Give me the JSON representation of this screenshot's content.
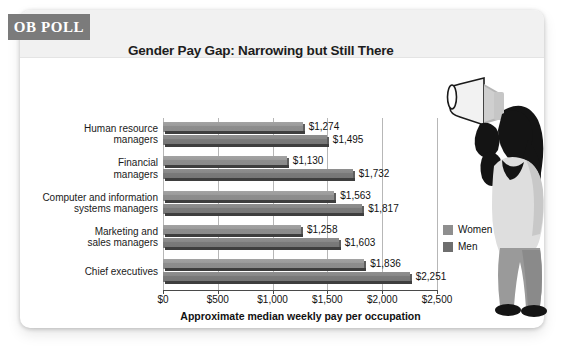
{
  "badge": {
    "label": "OB POLL"
  },
  "header": {
    "title": "Gender Pay Gap: Narrowing but Still There"
  },
  "legend": {
    "women_label": "Women",
    "men_label": "Men",
    "women_color": "#8f8f8f",
    "men_color": "#6e6e6e"
  },
  "illustration": {
    "name": "woman-with-megaphone"
  },
  "chart_data": {
    "type": "bar",
    "orientation": "horizontal",
    "title": "Gender Pay Gap: Narrowing but Still There",
    "xlabel": "Approximate median weekly pay per occupation",
    "ylabel": "",
    "xlim": [
      0,
      2500
    ],
    "grid": true,
    "legend_position": "right",
    "tick_labels": [
      "$0",
      "$500",
      "$1,000",
      "$1,500",
      "$2,000",
      "$2,500"
    ],
    "ticks": [
      0,
      500,
      1000,
      1500,
      2000,
      2500
    ],
    "categories": [
      "Human resource managers",
      "Financial managers",
      "Computer and information systems managers",
      "Marketing and sales managers",
      "Chief executives"
    ],
    "category_lines": [
      [
        "Human resource",
        "managers"
      ],
      [
        "Financial",
        "managers"
      ],
      [
        "Computer and information",
        "systems managers"
      ],
      [
        "Marketing and",
        "sales managers"
      ],
      [
        "Chief executives"
      ]
    ],
    "series": [
      {
        "name": "Women",
        "color": "#8f8f8f",
        "values": [
          1274,
          1130,
          1563,
          1258,
          1836
        ],
        "labels": [
          "$1,274",
          "$1,130",
          "$1,563",
          "$1,258",
          "$1,836"
        ]
      },
      {
        "name": "Men",
        "color": "#6e6e6e",
        "values": [
          1495,
          1732,
          1817,
          1603,
          2251
        ],
        "labels": [
          "$1,495",
          "$1,732",
          "$1,817",
          "$1,603",
          "$2,251"
        ]
      }
    ]
  }
}
